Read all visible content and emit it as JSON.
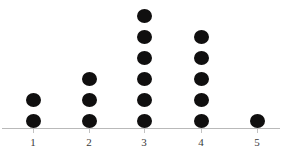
{
  "chart_data": {
    "type": "dot-plot",
    "title": "",
    "subtitle": "",
    "xlabel": "",
    "ylabel": "",
    "categories": [
      "1",
      "2",
      "3",
      "4",
      "5"
    ],
    "values": [
      2,
      3,
      6,
      5,
      1
    ],
    "series": [
      {
        "name": "count",
        "values": [
          2,
          3,
          6,
          5,
          1
        ]
      }
    ],
    "xlim": [
      0.5,
      5.5
    ],
    "ylim": [
      0,
      6
    ],
    "grid": false,
    "legend": null,
    "annotations": [],
    "style": {
      "background": "#ffffff",
      "dot_color": "#100f0f",
      "axis_color": "#b9b9b9",
      "tick_color": "#c2c2c2",
      "label_color": "#3a3a3a"
    },
    "geometry": {
      "baseline_y": 121,
      "axis_y": 128,
      "dot_spacing": 21,
      "dot_diameter": 15,
      "category_x": [
        33,
        89,
        144,
        201,
        257
      ]
    }
  }
}
